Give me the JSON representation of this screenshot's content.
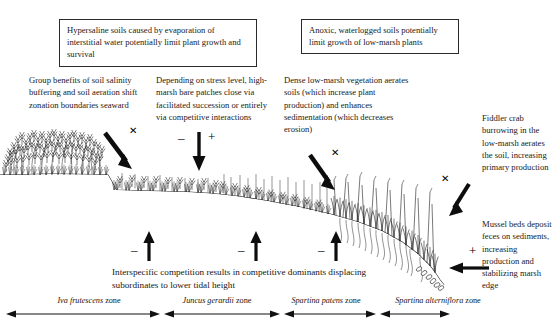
{
  "diagram": {
    "title_boxes": [
      {
        "id": "hypersaline-box",
        "text": "Hypersaline soils caused by evaporation of interstitial water potentially limit plant growth and survival"
      },
      {
        "id": "anoxic-box",
        "text": "Anoxic, waterlogged soils potentially limit growth of low-marsh plants"
      }
    ],
    "notes": [
      {
        "id": "group-benefits-note",
        "text": "Group benefits of soil salinity buffering and soil aeration shift zonation boundaries seaward"
      },
      {
        "id": "bare-patches-note",
        "text": "Depending on stress level, high-marsh bare patches close via facilitated succession or entirely via competitive interactions"
      },
      {
        "id": "dense-vegetation-note",
        "text": "Dense low-marsh vegetation aerates soils (which increase plant production) and enhances sedimentation (which decreases erosion)"
      },
      {
        "id": "fiddler-crab-note",
        "text": "Fiddler crab burrowing in the low-marsh aerates the soil, increasing primary production"
      },
      {
        "id": "mussel-beds-note",
        "text": "Mussel beds deposit feces on sediments, increasing production and stabilizing marsh edge"
      }
    ],
    "caption": "Interspecific competition results in competitive dominants displacing subordinates to lower tidal height",
    "zones": [
      {
        "name": "Iva frutescens",
        "suffix": " zone"
      },
      {
        "name": "Juncus gerardii",
        "suffix": " zone"
      },
      {
        "name": "Spartina patens",
        "suffix": " zone"
      },
      {
        "name": "Spartina alterniflora",
        "suffix": " zone"
      }
    ],
    "signs": {
      "minus": "–",
      "plus": "+",
      "cross": "✕"
    },
    "arrow_markers": [
      {
        "id": "marker-facilitation-seaward",
        "sign": "cross"
      },
      {
        "id": "marker-bare-patch-negative",
        "sign": "minus"
      },
      {
        "id": "marker-bare-patch-positive",
        "sign": "plus"
      },
      {
        "id": "marker-aeration-cross",
        "sign": "cross"
      },
      {
        "id": "marker-fiddler-cross",
        "sign": "cross"
      },
      {
        "id": "marker-competition-1",
        "sign": "minus"
      },
      {
        "id": "marker-competition-2",
        "sign": "minus"
      },
      {
        "id": "marker-competition-3",
        "sign": "minus"
      },
      {
        "id": "marker-mussel-positive",
        "sign": "plus"
      }
    ],
    "colors": {
      "ink": "#161616",
      "box_border": "#2b2b2b",
      "background": "#ffffff"
    }
  }
}
